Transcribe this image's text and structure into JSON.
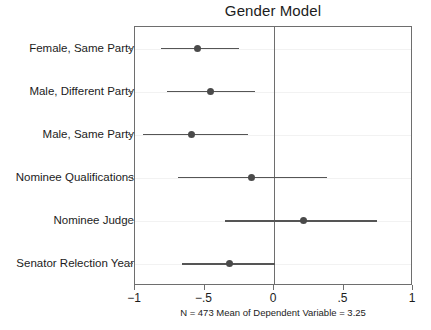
{
  "chart_data": {
    "type": "scatter",
    "title": "Gender Model",
    "subtitle": "",
    "xlabel": "",
    "ylabel": "",
    "caption": "N = 473 Mean of Dependent Variable = 3.25",
    "xlim": [
      -1,
      1
    ],
    "xticks": [
      -1,
      -0.5,
      0,
      0.5,
      1
    ],
    "xticklabels": [
      "−1",
      "−.5",
      "0",
      ".5",
      "1"
    ],
    "grid": true,
    "legend": false,
    "reference_line": 0,
    "categories": [
      "Female, Same Party",
      "Male, Different Party",
      "Male, Same Party",
      "Nominee Qualifications",
      "Nominee Judge",
      "Senator Relection Year"
    ],
    "values": [
      -0.55,
      -0.46,
      -0.59,
      -0.16,
      0.21,
      -0.32
    ],
    "ci_low": [
      -0.81,
      -0.77,
      -0.94,
      -0.69,
      -0.35,
      -0.66
    ],
    "ci_high": [
      -0.25,
      -0.14,
      -0.19,
      0.38,
      0.74,
      0.01
    ],
    "points": [
      {
        "label": "Female, Same Party",
        "estimate": -0.55,
        "ci_low": -0.81,
        "ci_high": -0.25
      },
      {
        "label": "Male, Different Party",
        "estimate": -0.46,
        "ci_low": -0.77,
        "ci_high": -0.14
      },
      {
        "label": "Male, Same Party",
        "estimate": -0.59,
        "ci_low": -0.94,
        "ci_high": -0.19
      },
      {
        "label": "Nominee Qualifications",
        "estimate": -0.16,
        "ci_low": -0.69,
        "ci_high": 0.38
      },
      {
        "label": "Nominee Judge",
        "estimate": 0.21,
        "ci_low": -0.35,
        "ci_high": 0.74
      },
      {
        "label": "Senator Relection Year",
        "estimate": -0.32,
        "ci_low": -0.66,
        "ci_high": 0.01
      }
    ],
    "n": 473,
    "mean_of_dependent_variable": 3.25,
    "colors": {
      "marker": "#4a4a4a",
      "ci": "#555555",
      "axis": "#6e6e6e",
      "grid": "#f2f2f2",
      "background": "#ffffff",
      "text": "#1c1c1c"
    }
  }
}
